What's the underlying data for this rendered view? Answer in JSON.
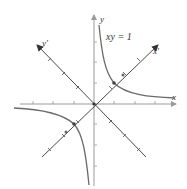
{
  "diagram": {
    "equation_label": "xy = 1",
    "axes": {
      "x_label": "x",
      "y_label": "y",
      "x_prime_label": "x′",
      "y_prime_label": "y′"
    },
    "colors": {
      "axis": "#9a9a9a",
      "rotated_axis": "#333333",
      "curve": "#6b6b6b",
      "point": "#333333"
    },
    "rotation_angle_deg": 45,
    "marked_points": [
      {
        "name": "vertex-1",
        "x": 1,
        "y": 1
      },
      {
        "name": "vertex-2",
        "x": -1,
        "y": -1
      }
    ]
  }
}
